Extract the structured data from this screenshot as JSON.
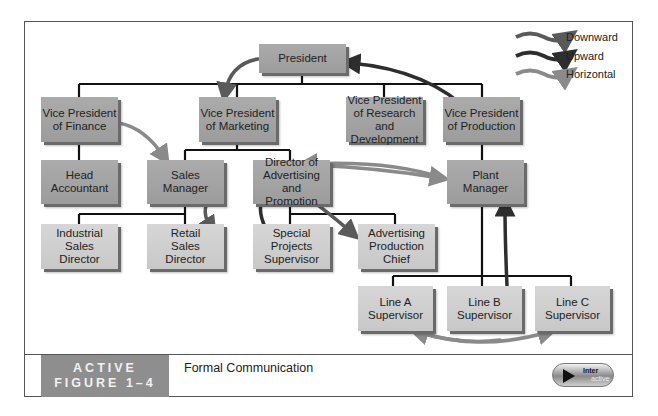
{
  "legend": {
    "items": [
      {
        "label": "Downward",
        "color": "#5a5a5a"
      },
      {
        "label": "Upward",
        "color": "#2e2e2e"
      },
      {
        "label": "Horizontal",
        "color": "#8a8a8a"
      }
    ]
  },
  "org_chart": {
    "president": "President",
    "vp_finance": "Vice President\nof Finance",
    "vp_marketing": "Vice President\nof Marketing",
    "vp_research": "Vice President\nof Research and\nDevelopment",
    "vp_production": "Vice President\nof Production",
    "head_accountant": "Head\nAccountant",
    "sales_manager": "Sales\nManager",
    "director_advertising": "Director of\nAdvertising and\nPromotion",
    "plant_manager": "Plant\nManager",
    "industrial_sales_director": "Industrial\nSales\nDirector",
    "retail_sales_director": "Retail\nSales\nDirector",
    "special_projects_supervisor": "Special\nProjects\nSupervisor",
    "advertising_production_chief": "Advertising\nProduction\nChief",
    "line_a_supervisor": "Line A\nSupervisor",
    "line_b_supervisor": "Line B\nSupervisor",
    "line_c_supervisor": "Line C\nSupervisor"
  },
  "caption": {
    "figure_label_line1": "ACTIVE",
    "figure_label_line2": "FIGURE 1–4",
    "title": "Formal Communication"
  },
  "interactive_button": {
    "line1": "Inter",
    "line2": "active"
  }
}
